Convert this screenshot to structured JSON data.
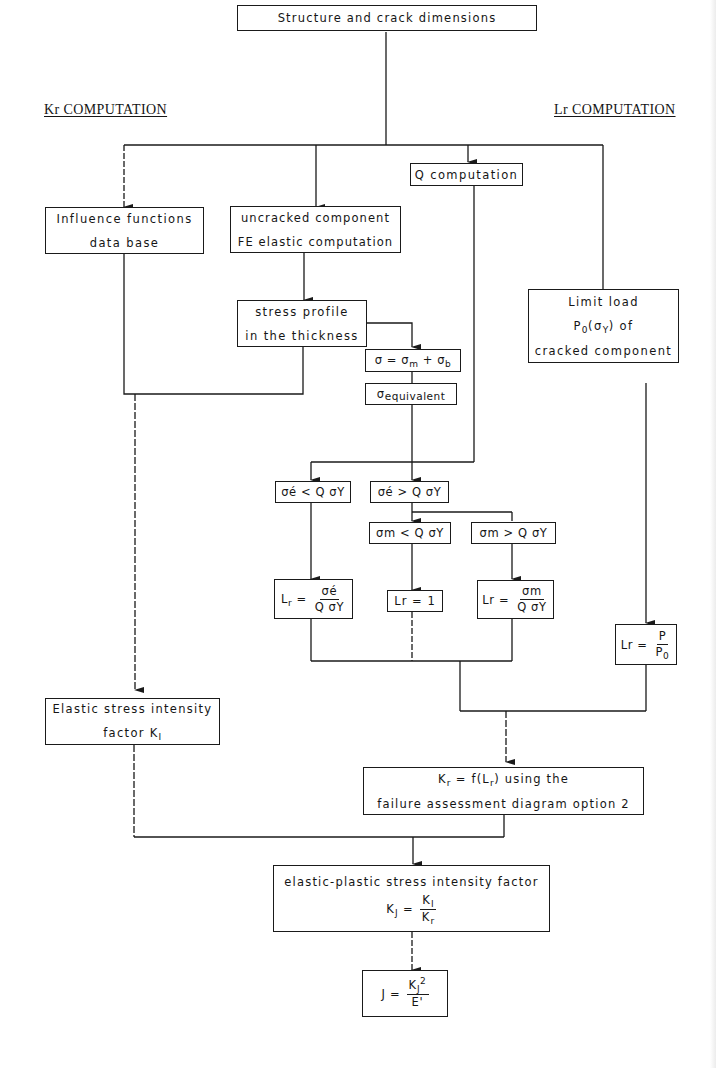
{
  "diagram": {
    "type": "flowchart",
    "headings": {
      "kr": "Kr COMPUTATION",
      "lr": "Lr COMPUTATION"
    },
    "nodes": {
      "start": {
        "text": "Structure and crack dimensions"
      },
      "influence": {
        "line1": "Influence functions",
        "line2": "data base"
      },
      "uncracked": {
        "line1": "uncracked component",
        "line2": "FE elastic computation"
      },
      "q_comp": {
        "text": "Q computation"
      },
      "limit_load": {
        "line1": "Limit load",
        "line2_main": "P",
        "line2_sub": "0",
        "line2_rest": "(σ",
        "line2_sub2": "Y",
        "line2_end": ") of",
        "line3": "cracked component"
      },
      "stress_profile": {
        "line1": "stress profile",
        "line2": "in the thickness"
      },
      "sigma_sum": {
        "a": "σ = σ",
        "sub_m": "m",
        "b": " + σ",
        "sub_b": "b"
      },
      "sigma_eq": {
        "main": "σ",
        "sub": "equivalent"
      },
      "cond_e_lt": {
        "text": "σé < Q σY"
      },
      "cond_e_gt": {
        "text": "σé > Q σY"
      },
      "cond_m_lt": {
        "text": "σm < Q σY"
      },
      "cond_m_gt": {
        "text": "σm > Q σY"
      },
      "lr_e": {
        "lhs": "L",
        "lhs_sub": "r",
        "eq": " =",
        "num": "σé",
        "den": "Q σY"
      },
      "lr_one": {
        "text": "Lr = 1"
      },
      "lr_m": {
        "lhs": "Lr",
        "eq": " =",
        "num": "σm",
        "den": "Q σY"
      },
      "lr_p": {
        "lhs": "Lr",
        "eq": " =",
        "num": "P",
        "den_main": "P",
        "den_sub": "0"
      },
      "elastic_ki": {
        "line1": "Elastic stress intensity",
        "line2": "factor K",
        "line2_sub": "I"
      },
      "kr_fad": {
        "l1_k": "K",
        "l1_ksub": "r",
        "l1_mid": " = f(L",
        "l1_lsub": "r",
        "l1_end": ") using the",
        "line2": "failure assessment diagram option 2"
      },
      "kj": {
        "line1": "elastic-plastic stress intensity factor",
        "lhs": "K",
        "lhs_sub": "J",
        "eq": " =",
        "num": "K",
        "num_sub": "I",
        "den": "K",
        "den_sub": "r"
      },
      "j": {
        "lhs": "J =",
        "num": "K",
        "num_sub": "J",
        "num_sup": "2",
        "den": "E'"
      }
    }
  }
}
